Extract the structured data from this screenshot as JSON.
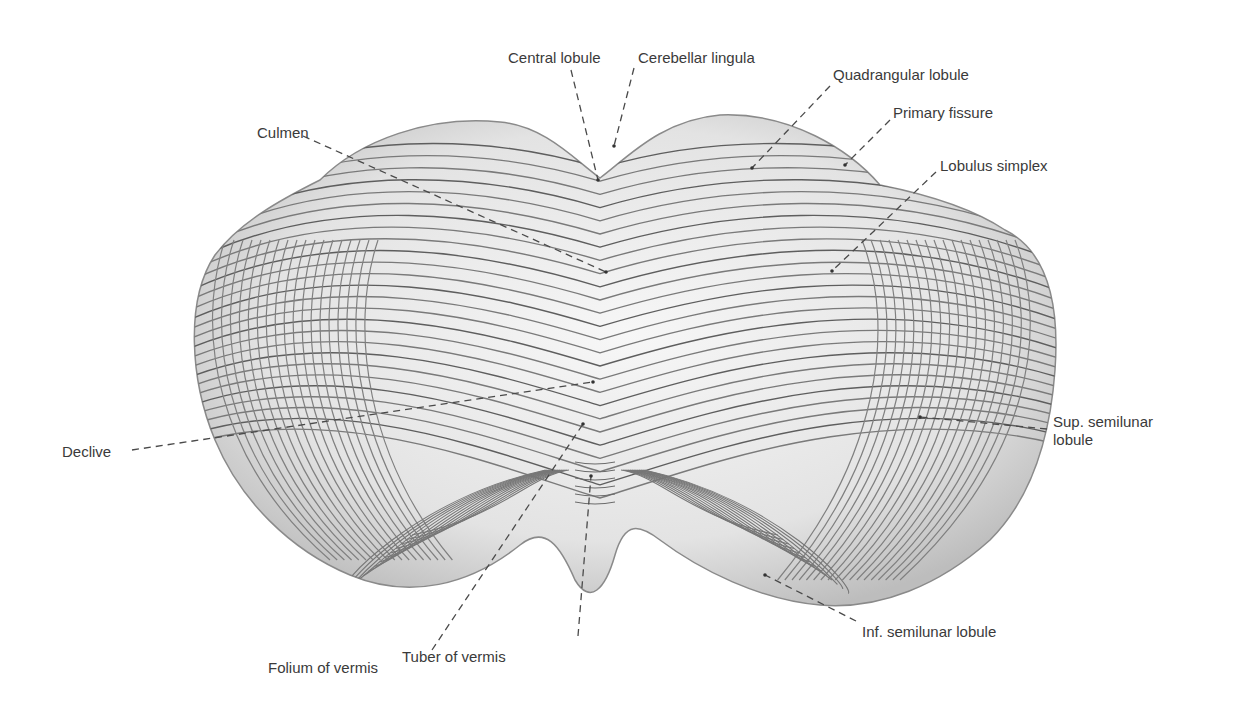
{
  "figure": {
    "colors": {
      "background": "#ffffff",
      "tissue_light": "#f3f3f3",
      "tissue_mid": "#c8c8c8",
      "folia_line": "#6b6b6b",
      "leader": "#4a4a4a",
      "text": "#3a3a3a"
    }
  },
  "labels": [
    {
      "id": "central-lobule",
      "text": "Central lobule",
      "x": 508,
      "y": 49
    },
    {
      "id": "cerebellar-lingula",
      "text": "Cerebellar lingula",
      "x": 638,
      "y": 49
    },
    {
      "id": "quadrangular-lobule",
      "text": "Quadrangular lobule",
      "x": 833,
      "y": 66
    },
    {
      "id": "primary-fissure",
      "text": "Primary fissure",
      "x": 893,
      "y": 104
    },
    {
      "id": "culmen",
      "text": "Culmen",
      "x": 257,
      "y": 124
    },
    {
      "id": "lobulus-simplex",
      "text": "Lobulus simplex",
      "x": 940,
      "y": 157
    },
    {
      "id": "declive",
      "text": "Declive",
      "x": 62,
      "y": 443
    },
    {
      "id": "sup-semilunar-lobule",
      "text": "Sup. semilunar lobule",
      "x": 1053,
      "y": 413
    },
    {
      "id": "inf-semilunar-lobule",
      "text": "Inf. semilunar lobule",
      "x": 862,
      "y": 623
    },
    {
      "id": "folium-of-vermis",
      "text": "Folium of vermis",
      "x": 268,
      "y": 659
    },
    {
      "id": "tuber-of-vermis",
      "text": "Tuber of vermis",
      "x": 402,
      "y": 648
    }
  ],
  "leaders": [
    {
      "id": "central-lobule",
      "x1": 571,
      "y1": 70,
      "x2": 598,
      "y2": 180
    },
    {
      "id": "cerebellar-lingula",
      "x1": 634,
      "y1": 68,
      "x2": 614,
      "y2": 146
    },
    {
      "id": "quadrangular-lobule",
      "x1": 830,
      "y1": 86,
      "x2": 752,
      "y2": 168
    },
    {
      "id": "primary-fissure",
      "x1": 890,
      "y1": 120,
      "x2": 845,
      "y2": 165
    },
    {
      "id": "culmen",
      "x1": 303,
      "y1": 136,
      "x2": 606,
      "y2": 272
    },
    {
      "id": "lobulus-simplex",
      "x1": 936,
      "y1": 172,
      "x2": 832,
      "y2": 271
    },
    {
      "id": "declive",
      "x1": 132,
      "y1": 450,
      "x2": 593,
      "y2": 382
    },
    {
      "id": "sup-semilunar-lobule",
      "x1": 1047,
      "y1": 429,
      "x2": 920,
      "y2": 417
    },
    {
      "id": "inf-semilunar-lobule",
      "x1": 856,
      "y1": 621,
      "x2": 765,
      "y2": 575
    },
    {
      "id": "folium-of-vermis",
      "x1": 432,
      "y1": 650,
      "x2": 583,
      "y2": 424
    },
    {
      "id": "tuber-of-vermis",
      "x1": 578,
      "y1": 636,
      "x2": 591,
      "y2": 476
    }
  ]
}
